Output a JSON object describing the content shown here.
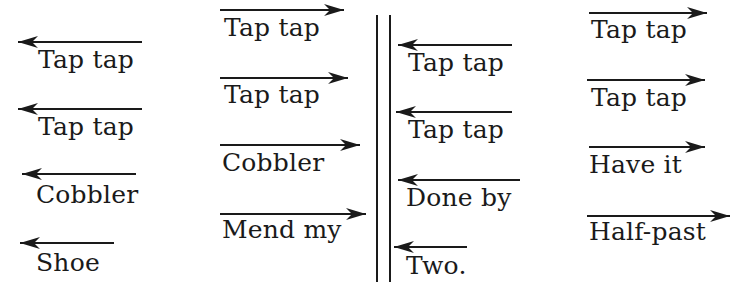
{
  "diagram": {
    "colors": {
      "ink": "#1a1a1a",
      "background": "#ffffff"
    },
    "columns": [
      {
        "direction": "left",
        "items": [
          {
            "label": "Tap tap",
            "x": 38,
            "y": 47,
            "arrow": {
              "x1": 18,
              "x2": 142,
              "y": 42
            }
          },
          {
            "label": "Tap tap",
            "x": 38,
            "y": 114,
            "arrow": {
              "x1": 18,
              "x2": 142,
              "y": 109
            }
          },
          {
            "label": "Cobbler",
            "x": 36,
            "y": 182,
            "arrow": {
              "x1": 22,
              "x2": 136,
              "y": 174
            }
          },
          {
            "label": "Shoe",
            "x": 36,
            "y": 250,
            "arrow": {
              "x1": 20,
              "x2": 114,
              "y": 243
            }
          }
        ]
      },
      {
        "direction": "right",
        "items": [
          {
            "label": "Tap tap",
            "x": 224,
            "y": 15,
            "arrow": {
              "x1": 220,
              "x2": 344,
              "y": 10
            }
          },
          {
            "label": "Tap tap",
            "x": 224,
            "y": 82,
            "arrow": {
              "x1": 220,
              "x2": 348,
              "y": 78
            }
          },
          {
            "label": "Cobbler",
            "x": 222,
            "y": 150,
            "arrow": {
              "x1": 220,
              "x2": 360,
              "y": 145
            }
          },
          {
            "label": "Mend my",
            "x": 222,
            "y": 217,
            "arrow": {
              "x1": 220,
              "x2": 366,
              "y": 214
            }
          }
        ]
      },
      {
        "direction": "left",
        "items": [
          {
            "label": "Tap tap",
            "x": 408,
            "y": 50,
            "arrow": {
              "x1": 398,
              "x2": 512,
              "y": 45
            }
          },
          {
            "label": "Tap tap",
            "x": 408,
            "y": 117,
            "arrow": {
              "x1": 396,
              "x2": 512,
              "y": 112
            }
          },
          {
            "label": "Done by",
            "x": 406,
            "y": 185,
            "arrow": {
              "x1": 398,
              "x2": 520,
              "y": 180
            }
          },
          {
            "label": "Two.",
            "x": 406,
            "y": 253,
            "arrow": {
              "x1": 394,
              "x2": 467,
              "y": 247
            }
          }
        ]
      },
      {
        "direction": "right",
        "items": [
          {
            "label": "Tap tap",
            "x": 591,
            "y": 17,
            "arrow": {
              "x1": 589,
              "x2": 707,
              "y": 13
            }
          },
          {
            "label": "Tap tap",
            "x": 591,
            "y": 85,
            "arrow": {
              "x1": 587,
              "x2": 705,
              "y": 80
            }
          },
          {
            "label": "Have it",
            "x": 589,
            "y": 152,
            "arrow": {
              "x1": 589,
              "x2": 705,
              "y": 147
            }
          },
          {
            "label": "Half-past",
            "x": 589,
            "y": 219,
            "arrow": {
              "x1": 587,
              "x2": 730,
              "y": 216
            }
          }
        ]
      }
    ],
    "divider": {
      "x1": 377,
      "x2": 390,
      "y_top": 15,
      "y_bottom": 282
    }
  }
}
